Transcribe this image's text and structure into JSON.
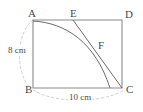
{
  "figure": {
    "caption": "Rectangle ABCD with folded edge arc from A to side BC and crease line from E to C",
    "vertices": [
      {
        "id": "A",
        "label": "A",
        "x": 33,
        "y": 20,
        "label_x": 28,
        "label_y": 8
      },
      {
        "id": "E",
        "label": "E",
        "x": 73,
        "y": 20,
        "label_x": 70,
        "label_y": 8
      },
      {
        "id": "D",
        "label": "D",
        "x": 122,
        "y": 21,
        "label_x": 125,
        "label_y": 9
      },
      {
        "id": "B",
        "label": "B",
        "x": 33,
        "y": 88,
        "label_x": 25,
        "label_y": 84
      },
      {
        "id": "C",
        "label": "C",
        "x": 122,
        "y": 88,
        "label_x": 126,
        "label_y": 84
      },
      {
        "id": "F",
        "label": "F",
        "x": 95,
        "y": 47,
        "label_x": 98,
        "label_y": 40
      }
    ],
    "dimensions": [
      {
        "id": "height",
        "label": "8 cm",
        "side": "AB",
        "value": 8,
        "unit": "cm"
      },
      {
        "id": "width",
        "label": "10 cm",
        "side": "BC",
        "value": 10,
        "unit": "cm"
      }
    ],
    "colors": {
      "stroke": "#6b6b6b",
      "rect_stroke": "#8a8a8a",
      "dashed_stroke": "#c9c9c9",
      "text": "#4a4a4a",
      "background": "#ffffff"
    }
  }
}
